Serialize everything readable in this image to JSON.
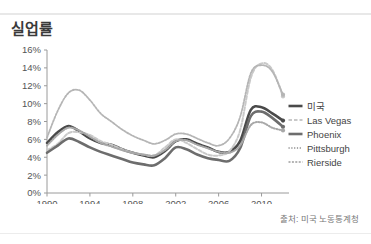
{
  "chart_title": "실업률",
  "source_note": "출처: 미국 노동통계청",
  "legend": {
    "items": [
      {
        "label": "미국",
        "style": "solid-thick",
        "color": "#4a4a4a",
        "icon": "legend-line-icon"
      },
      {
        "label": "Las Vegas",
        "style": "dashed-light",
        "color": "#c9c9c9",
        "icon": "legend-line-icon"
      },
      {
        "label": "Phoenix",
        "style": "solid-thick",
        "color": "#6d6d6d",
        "icon": "legend-line-icon"
      },
      {
        "label": "Pittsburgh",
        "style": "dotted",
        "color": "#a8a8a8",
        "icon": "legend-line-icon"
      },
      {
        "label": "Rierside",
        "style": "wavy",
        "color": "#b5b5b5",
        "icon": "legend-line-icon"
      }
    ]
  },
  "axis": {
    "y_ticks": [
      "0%",
      "2%",
      "4%",
      "6%",
      "8%",
      "10%",
      "12%",
      "14%",
      "16%"
    ],
    "x_ticks": [
      "1990",
      "1994",
      "1998",
      "2002",
      "2006",
      "2010"
    ]
  },
  "chart_data": {
    "type": "line",
    "title": "실업률",
    "xlabel": "",
    "ylabel": "",
    "ylim": [
      0,
      16
    ],
    "xlim": [
      1990,
      2012
    ],
    "grid": false,
    "legend_position": "right",
    "y_tick_values": [
      0,
      2,
      4,
      6,
      8,
      10,
      12,
      14,
      16
    ],
    "x_tick_values": [
      1990,
      1994,
      1998,
      2002,
      2006,
      2010
    ],
    "annotations": [
      "출처: 미국 노동통계청"
    ],
    "x": [
      1990,
      1991,
      1992,
      1993,
      1994,
      1995,
      1996,
      1997,
      1998,
      1999,
      2000,
      2001,
      2002,
      2003,
      2004,
      2005,
      2006,
      2007,
      2008,
      2009,
      2010,
      2011,
      2012
    ],
    "series": [
      {
        "name": "미국",
        "color": "#4a4a4a",
        "style": "solid-thick",
        "values": [
          5.6,
          6.8,
          7.5,
          6.9,
          6.1,
          5.6,
          5.4,
          4.9,
          4.5,
          4.2,
          4.0,
          4.7,
          5.8,
          6.0,
          5.5,
          5.1,
          4.6,
          4.6,
          5.8,
          9.3,
          9.6,
          8.9,
          8.1
        ]
      },
      {
        "name": "Las Vegas",
        "color": "#c9c9c9",
        "style": "dashed-light",
        "values": [
          4.8,
          5.5,
          6.7,
          6.8,
          6.5,
          5.8,
          5.4,
          4.9,
          4.5,
          4.3,
          4.2,
          5.1,
          6.0,
          5.6,
          4.9,
          4.3,
          4.2,
          4.7,
          7.0,
          12.9,
          14.5,
          13.8,
          10.8
        ]
      },
      {
        "name": "Phoenix",
        "color": "#6d6d6d",
        "style": "solid-thick",
        "values": [
          4.5,
          5.3,
          6.1,
          5.7,
          5.1,
          4.6,
          4.2,
          3.8,
          3.4,
          3.2,
          3.1,
          3.9,
          5.1,
          4.9,
          4.3,
          3.9,
          3.7,
          3.6,
          5.0,
          8.6,
          9.1,
          8.4,
          7.4
        ]
      },
      {
        "name": "Pittsburgh",
        "color": "#a8a8a8",
        "style": "dotted",
        "values": [
          5.3,
          6.5,
          7.3,
          7.0,
          6.3,
          5.6,
          5.2,
          4.8,
          4.5,
          4.3,
          4.2,
          4.8,
          5.8,
          5.9,
          5.4,
          5.0,
          4.6,
          4.5,
          5.3,
          7.6,
          7.9,
          7.3,
          7.0
        ]
      },
      {
        "name": "Rierside",
        "color": "#b5b5b5",
        "style": "wavy",
        "values": [
          6.2,
          9.2,
          11.2,
          11.5,
          10.4,
          8.9,
          8.0,
          7.1,
          6.4,
          5.9,
          5.5,
          5.9,
          6.6,
          6.6,
          6.1,
          5.6,
          5.3,
          6.1,
          8.5,
          13.4,
          14.3,
          13.6,
          11.0
        ]
      }
    ]
  }
}
